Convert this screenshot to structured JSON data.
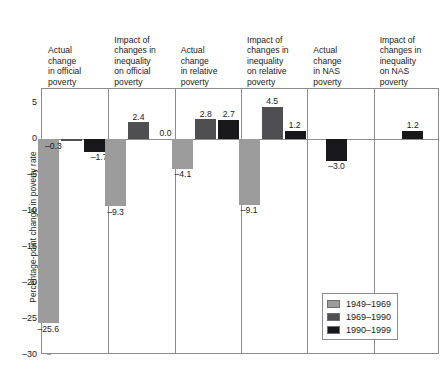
{
  "chart_data": {
    "type": "bar",
    "title": "",
    "subtitle": "",
    "xlabel": "",
    "ylabel": "Percentage-point change in poverty rate",
    "ylim": [
      -30,
      7
    ],
    "yticks": [
      5,
      0,
      -5,
      -10,
      -15,
      -20,
      -25,
      -30
    ],
    "ytick_labels": [
      "5",
      "0",
      "–5",
      "–10",
      "–15",
      "–20",
      "–25",
      "–30"
    ],
    "grid": false,
    "legend_position": "bottom-right",
    "legend": [
      "1949–1969",
      "1969–1990",
      "1990–1999"
    ],
    "series_colors": [
      "#9c9c9c",
      "#4f4f51",
      "#18181a"
    ],
    "categories": [
      "Actual change in official poverty",
      "Impact of changes in inequality on official poverty",
      "Actual change in relative poverty",
      "Impact of changes in inequality on relative poverty",
      "Actual change in NAS poverty",
      "Impact of changes in inequality on NAS poverty"
    ],
    "category_lines": [
      [
        "Actual",
        "change",
        "in official",
        "poverty"
      ],
      [
        "Impact of",
        "changes in",
        "inequality",
        "on official",
        "poverty"
      ],
      [
        "Actual",
        "change",
        "in relative",
        "poverty"
      ],
      [
        "Impact of",
        "changes in",
        "inequality",
        "on relative",
        "poverty"
      ],
      [
        "Actual",
        "change",
        "in NAS",
        "poverty"
      ],
      [
        "Impact of",
        "changes in",
        "inequality",
        "on NAS",
        "poverty"
      ]
    ],
    "series": [
      {
        "name": "1949–1969",
        "values": [
          -25.6,
          -9.3,
          -4.1,
          -9.1,
          null,
          null
        ]
      },
      {
        "name": "1969–1990",
        "values": [
          -0.3,
          2.4,
          2.8,
          4.5,
          null,
          null
        ]
      },
      {
        "name": "1990–1999",
        "values": [
          -1.7,
          0.0,
          2.7,
          1.2,
          -3.0,
          1.2
        ]
      }
    ],
    "data_labels": [
      [
        "–25.6",
        "–9.3",
        "–4.1",
        "–9.1",
        "",
        ""
      ],
      [
        "–0.3",
        "2.4",
        "2.8",
        "4.5",
        "",
        ""
      ],
      [
        "–1.7",
        "0.0",
        "2.7",
        "1.2",
        "–3.0",
        "1.2"
      ]
    ]
  },
  "panels": [
    {
      "index": 0,
      "header_lines": [
        "Actual",
        "change",
        "in official",
        "poverty"
      ]
    },
    {
      "index": 1,
      "header_lines": [
        "Impact of",
        "changes in",
        "inequality",
        "on official",
        "poverty"
      ]
    },
    {
      "index": 2,
      "header_lines": [
        "Actual",
        "change",
        "in relative",
        "poverty"
      ]
    },
    {
      "index": 3,
      "header_lines": [
        "Impact of",
        "changes in",
        "inequality",
        "on relative",
        "poverty"
      ]
    },
    {
      "index": 4,
      "header_lines": [
        "Actual",
        "change",
        "in NAS",
        "poverty"
      ]
    },
    {
      "index": 5,
      "header_lines": [
        "Impact of",
        "changes in",
        "inequality",
        "on NAS",
        "poverty"
      ]
    }
  ],
  "axis": {
    "y_title": "Percentage-point change in poverty rate"
  },
  "legend": {
    "items": [
      {
        "label": "1949–1969",
        "color": "#9c9c9c"
      },
      {
        "label": "1969–1990",
        "color": "#4f4f51"
      },
      {
        "label": "1990–1999",
        "color": "#18181a"
      }
    ]
  }
}
